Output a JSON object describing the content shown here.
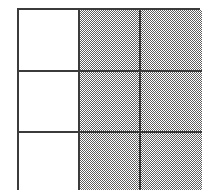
{
  "figure": {
    "line_color": "#3b3b3b",
    "shade_color": "#969696",
    "background_color": "#ffffff",
    "columns": 3,
    "rows": 3
  },
  "chart_data": {
    "type": "heatmap",
    "xlabel": "",
    "ylabel": "",
    "grid": true,
    "legend_position": "none",
    "categories": [
      "col-1",
      "col-2",
      "col-3"
    ],
    "row_labels": [
      "row-1",
      "row-2",
      "row-3"
    ],
    "values": [
      [
        0,
        1,
        1
      ],
      [
        0,
        1,
        1
      ],
      [
        0,
        1,
        1
      ]
    ],
    "value_legend": {
      "0": "unshaded",
      "1": "shaded"
    }
  },
  "cells": [
    {
      "id": "cell-r1c1",
      "row": 1,
      "col": 1,
      "state": "unshaded"
    },
    {
      "id": "cell-r1c2",
      "row": 1,
      "col": 2,
      "state": "shaded"
    },
    {
      "id": "cell-r1c3",
      "row": 1,
      "col": 3,
      "state": "shaded"
    },
    {
      "id": "cell-r2c1",
      "row": 2,
      "col": 1,
      "state": "unshaded"
    },
    {
      "id": "cell-r2c2",
      "row": 2,
      "col": 2,
      "state": "shaded"
    },
    {
      "id": "cell-r2c3",
      "row": 2,
      "col": 3,
      "state": "shaded"
    },
    {
      "id": "cell-r3c1",
      "row": 3,
      "col": 1,
      "state": "unshaded"
    },
    {
      "id": "cell-r3c2",
      "row": 3,
      "col": 2,
      "state": "shaded"
    },
    {
      "id": "cell-r3c3",
      "row": 3,
      "col": 3,
      "state": "shaded"
    }
  ]
}
